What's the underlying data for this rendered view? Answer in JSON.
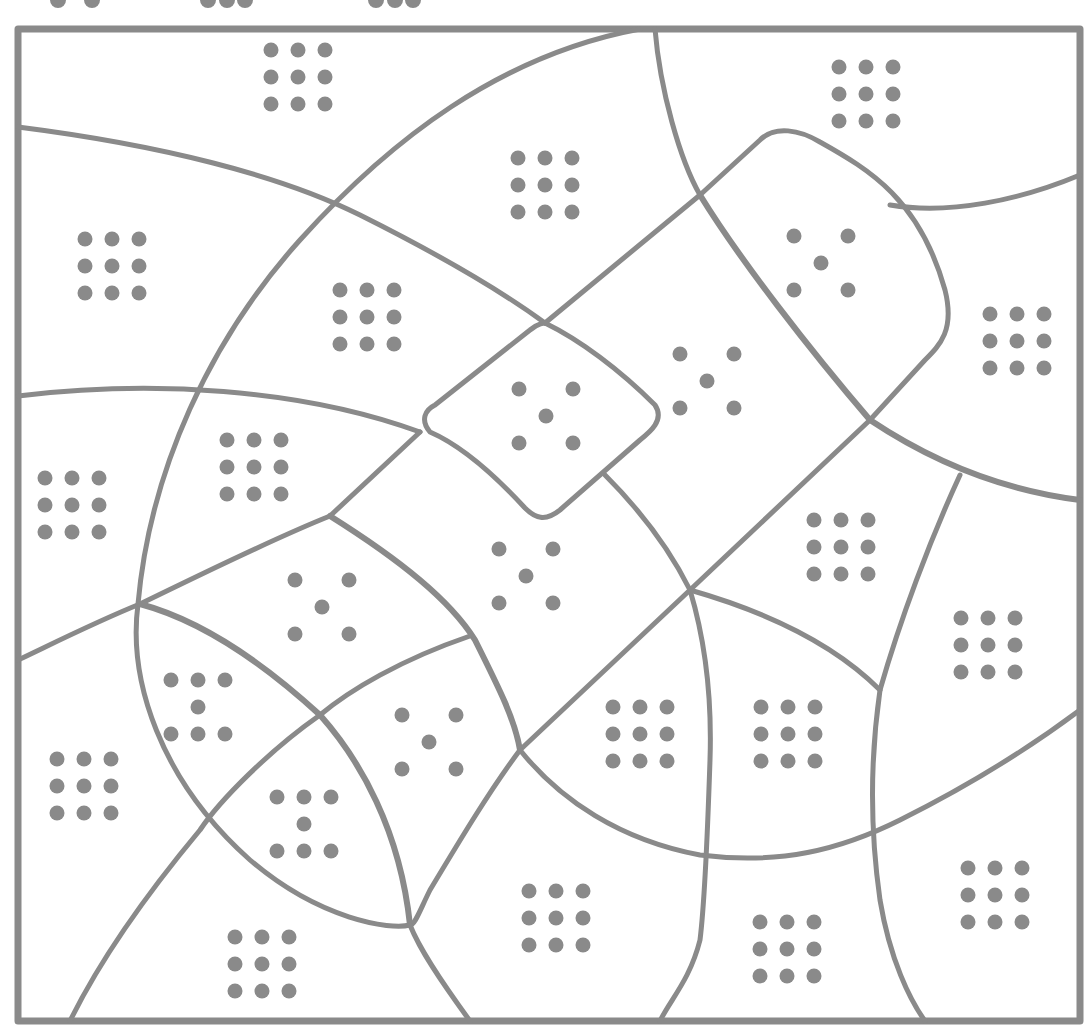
{
  "puzzle": {
    "type": "region-dot-coloring",
    "stroke_color": "#8a8a8a",
    "background": "#ffffff",
    "frame": {
      "x": 18,
      "y": 29,
      "w": 1062,
      "h": 992
    },
    "top_partial_dots": [
      {
        "x": 58,
        "y": 0
      },
      {
        "x": 92,
        "y": 0
      },
      {
        "x": 208,
        "y": 0
      },
      {
        "x": 227,
        "y": 0
      },
      {
        "x": 245,
        "y": 0
      },
      {
        "x": 376,
        "y": 0
      },
      {
        "x": 395,
        "y": 0
      },
      {
        "x": 413,
        "y": 0
      }
    ],
    "regions": [
      {
        "id": "r01",
        "pattern": "grid9",
        "cx": 298,
        "cy": 77
      },
      {
        "id": "r02",
        "pattern": "grid9",
        "cx": 545,
        "cy": 185
      },
      {
        "id": "r03",
        "pattern": "grid9",
        "cx": 866,
        "cy": 94
      },
      {
        "id": "r04",
        "pattern": "grid9",
        "cx": 112,
        "cy": 266
      },
      {
        "id": "r05",
        "pattern": "grid9",
        "cx": 367,
        "cy": 317
      },
      {
        "id": "r06",
        "pattern": "five",
        "cx": 821,
        "cy": 263
      },
      {
        "id": "r07",
        "pattern": "grid9",
        "cx": 1017,
        "cy": 341
      },
      {
        "id": "r08",
        "pattern": "five",
        "cx": 546,
        "cy": 416
      },
      {
        "id": "r09",
        "pattern": "five",
        "cx": 707,
        "cy": 381
      },
      {
        "id": "r10",
        "pattern": "grid9",
        "cx": 254,
        "cy": 467
      },
      {
        "id": "r11",
        "pattern": "grid9",
        "cx": 72,
        "cy": 505
      },
      {
        "id": "r12",
        "pattern": "five",
        "cx": 526,
        "cy": 576
      },
      {
        "id": "r13",
        "pattern": "grid9",
        "cx": 841,
        "cy": 547
      },
      {
        "id": "r14",
        "pattern": "five",
        "cx": 322,
        "cy": 607
      },
      {
        "id": "r15",
        "pattern": "grid9",
        "cx": 988,
        "cy": 645
      },
      {
        "id": "r16",
        "pattern": "seven",
        "cx": 198,
        "cy": 707
      },
      {
        "id": "r17",
        "pattern": "five",
        "cx": 429,
        "cy": 742
      },
      {
        "id": "r18",
        "pattern": "grid9",
        "cx": 640,
        "cy": 734
      },
      {
        "id": "r19",
        "pattern": "grid9",
        "cx": 788,
        "cy": 734
      },
      {
        "id": "r20",
        "pattern": "grid9",
        "cx": 84,
        "cy": 786
      },
      {
        "id": "r21",
        "pattern": "seven",
        "cx": 304,
        "cy": 824
      },
      {
        "id": "r22",
        "pattern": "grid9",
        "cx": 556,
        "cy": 918
      },
      {
        "id": "r23",
        "pattern": "grid9",
        "cx": 995,
        "cy": 895
      },
      {
        "id": "r24",
        "pattern": "grid9",
        "cx": 262,
        "cy": 964
      },
      {
        "id": "r25",
        "pattern": "grid9",
        "cx": 787,
        "cy": 949
      }
    ]
  }
}
